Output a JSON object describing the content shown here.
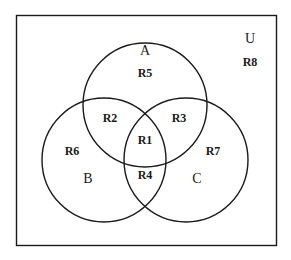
{
  "diagram": {
    "type": "venn-3-set",
    "background_color": "#ffffff",
    "stroke_color": "#1a1a1a",
    "universe": {
      "label": "U",
      "region_label": "R8",
      "description": "Rectangle representing the universal set"
    },
    "sets": [
      {
        "id": "A",
        "label": "A",
        "region_label": "R5"
      },
      {
        "id": "B",
        "label": "B",
        "region_label": "R6"
      },
      {
        "id": "C",
        "label": "C",
        "region_label": "R7"
      }
    ],
    "regions": [
      {
        "id": "R1",
        "label": "R1",
        "meaning": "A and B and C"
      },
      {
        "id": "R2",
        "label": "R2",
        "meaning": "A and B only"
      },
      {
        "id": "R3",
        "label": "R3",
        "meaning": "A and C only"
      },
      {
        "id": "R4",
        "label": "R4",
        "meaning": "B and C only"
      },
      {
        "id": "R5",
        "label": "R5",
        "meaning": "A only"
      },
      {
        "id": "R6",
        "label": "R6",
        "meaning": "B only"
      },
      {
        "id": "R7",
        "label": "R7",
        "meaning": "C only"
      },
      {
        "id": "R8",
        "label": "R8",
        "meaning": "outside all sets"
      }
    ]
  },
  "labels": {
    "universe_letter": "U",
    "universe_region": "R8",
    "set_a": "A",
    "set_b": "B",
    "set_c": "C",
    "r1": "R1",
    "r2": "R2",
    "r3": "R3",
    "r4": "R4",
    "r5": "R5",
    "r6": "R6",
    "r7": "R7",
    "r8": "R8"
  }
}
